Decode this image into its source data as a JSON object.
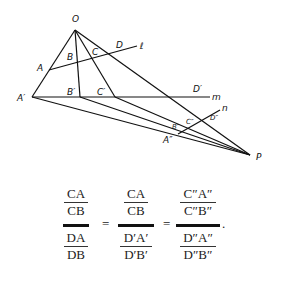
{
  "diagram": {
    "points": {
      "O": {
        "label": "O",
        "x": 75,
        "y": 30,
        "lx": 72,
        "ly": 22
      },
      "A": {
        "label": "A",
        "x": 49,
        "y": 70,
        "lx": 37,
        "ly": 71
      },
      "B": {
        "label": "B",
        "x": 71,
        "y": 63,
        "lx": 67,
        "ly": 60
      },
      "C": {
        "label": "C",
        "x": 93,
        "y": 57,
        "lx": 92,
        "ly": 55
      },
      "D": {
        "label": "D",
        "x": 117,
        "y": 51,
        "lx": 116,
        "ly": 48
      },
      "A1": {
        "label": "A′",
        "x": 32,
        "y": 97,
        "lx": 17,
        "ly": 101
      },
      "B1": {
        "label": "B′",
        "x": 80,
        "y": 97,
        "lx": 67,
        "ly": 95
      },
      "C1": {
        "label": "C′",
        "x": 115,
        "y": 97,
        "lx": 97,
        "ly": 95
      },
      "D1": {
        "label": "D′",
        "x": 196,
        "y": 97,
        "lx": 193,
        "ly": 92
      },
      "P": {
        "label": "P",
        "x": 250,
        "y": 155,
        "lx": 256,
        "ly": 160
      },
      "A2": {
        "label": "A″",
        "x": 178,
        "y": 134,
        "lx": 163,
        "ly": 143
      },
      "B2": {
        "label": "B″",
        "x": 186,
        "y": 129,
        "lx": 173,
        "ly": 129
      },
      "C2": {
        "label": "C″",
        "x": 197,
        "y": 124,
        "lx": 186,
        "ly": 124
      },
      "D2": {
        "label": "D″",
        "x": 214,
        "y": 113,
        "lx": 210,
        "ly": 120
      }
    },
    "line_labels": {
      "l": {
        "label": "ℓ",
        "x": 140,
        "y": 48
      },
      "m": {
        "label": "m",
        "x": 212,
        "y": 100
      },
      "n": {
        "label": "n",
        "x": 222,
        "y": 111
      }
    }
  },
  "equation": {
    "f1": {
      "top_num": "CA",
      "top_den": "CB",
      "bot_num": "DA",
      "bot_den": "DB"
    },
    "f2": {
      "top_num": "CA",
      "top_den": "CB",
      "bot_num": "D′A′",
      "bot_den": "D′B′"
    },
    "f3": {
      "top_num": "C″A″",
      "top_den": "C″B″",
      "bot_num": "D″A″",
      "bot_den": "D″B″"
    },
    "equals": "=",
    "period": "."
  }
}
